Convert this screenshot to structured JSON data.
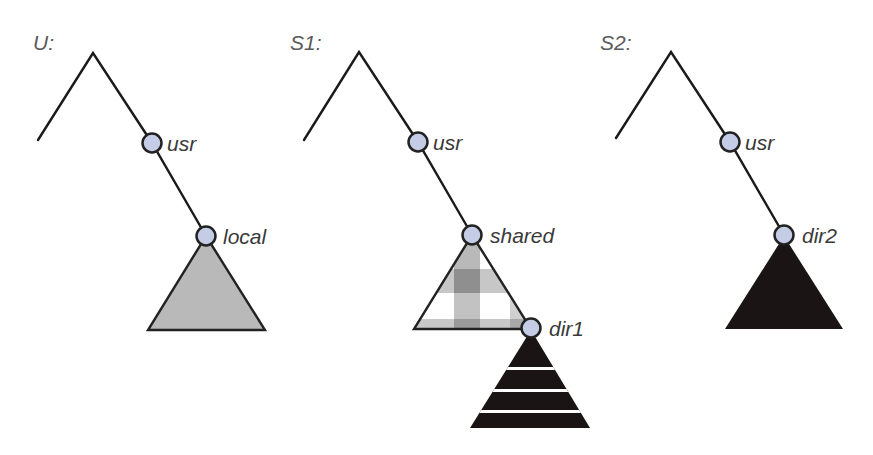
{
  "diagram": {
    "colors": {
      "node_fill": "#c5cde6",
      "line": "#1a1a1a",
      "gray_subtree": "#b9b9b9",
      "black_subtree": "#1a1414",
      "plaid_light": "#ffffff",
      "plaid_mid": "#c8c8c8",
      "plaid_dark": "#8e8e8e"
    },
    "trees": [
      {
        "title": "U:",
        "nodes": [
          {
            "label": "usr"
          },
          {
            "label": "local",
            "subtree": "gray-solid"
          }
        ]
      },
      {
        "title": "S1:",
        "nodes": [
          {
            "label": "usr"
          },
          {
            "label": "shared",
            "subtree": "plaid"
          },
          {
            "label": "dir1",
            "subtree": "black-striped"
          }
        ]
      },
      {
        "title": "S2:",
        "nodes": [
          {
            "label": "usr"
          },
          {
            "label": "dir2",
            "subtree": "black-solid"
          }
        ]
      }
    ]
  }
}
